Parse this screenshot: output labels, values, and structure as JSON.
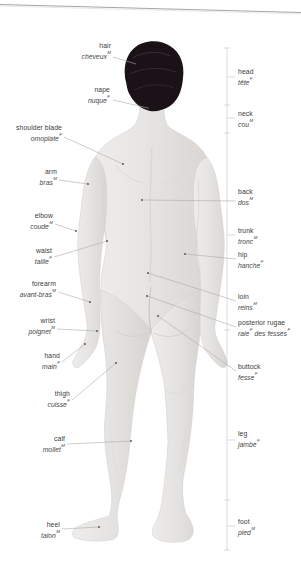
{
  "colors": {
    "background": "#ffffff",
    "skin_light": "#efedec",
    "skin_dark": "#d8d5d2",
    "hair": "#1a1216",
    "leader_line": "#ababab",
    "bracket_line": "#c2c2c2",
    "label_text": "#3c3c3c"
  },
  "labels": {
    "left": [
      {
        "en": "hair",
        "fr": "cheveux",
        "gender": "M"
      },
      {
        "en": "nape",
        "fr": "nuque",
        "gender": "F"
      },
      {
        "en": "shoulder blade",
        "fr": "omoplate",
        "gender": "F"
      },
      {
        "en": "arm",
        "fr": "bras",
        "gender": "M"
      },
      {
        "en": "elbow",
        "fr": "coude",
        "gender": "M"
      },
      {
        "en": "waist",
        "fr": "taille",
        "gender": "F"
      },
      {
        "en": "forearm",
        "fr": "avant-bras",
        "gender": "M"
      },
      {
        "en": "wrist",
        "fr": "poignet",
        "gender": "M"
      },
      {
        "en": "hand",
        "fr": "main",
        "gender": "F"
      },
      {
        "en": "thigh",
        "fr": "cuisse",
        "gender": "F"
      },
      {
        "en": "calf",
        "fr": "mollet",
        "gender": "M"
      },
      {
        "en": "heel",
        "fr": "talon",
        "gender": "M"
      }
    ],
    "right": [
      {
        "en": "head",
        "fr": "tête",
        "gender": "F"
      },
      {
        "en": "neck",
        "fr": "cou",
        "gender": "M"
      },
      {
        "en": "back",
        "fr": "dos",
        "gender": "M"
      },
      {
        "en": "trunk",
        "fr": "tronc",
        "gender": "M"
      },
      {
        "en": "hip",
        "fr": "hanche",
        "gender": "F"
      },
      {
        "en": "loin",
        "fr": "reins",
        "gender": "M"
      },
      {
        "en": "posterior rugae",
        "fr": "raie",
        "gender": "F",
        "fr2": "des fesses",
        "gender2": "F"
      },
      {
        "en": "buttock",
        "fr": "fesse",
        "gender": "F"
      },
      {
        "en": "leg",
        "fr": "jambe",
        "gender": "F"
      },
      {
        "en": "foot",
        "fr": "pied",
        "gender": "M"
      }
    ]
  }
}
